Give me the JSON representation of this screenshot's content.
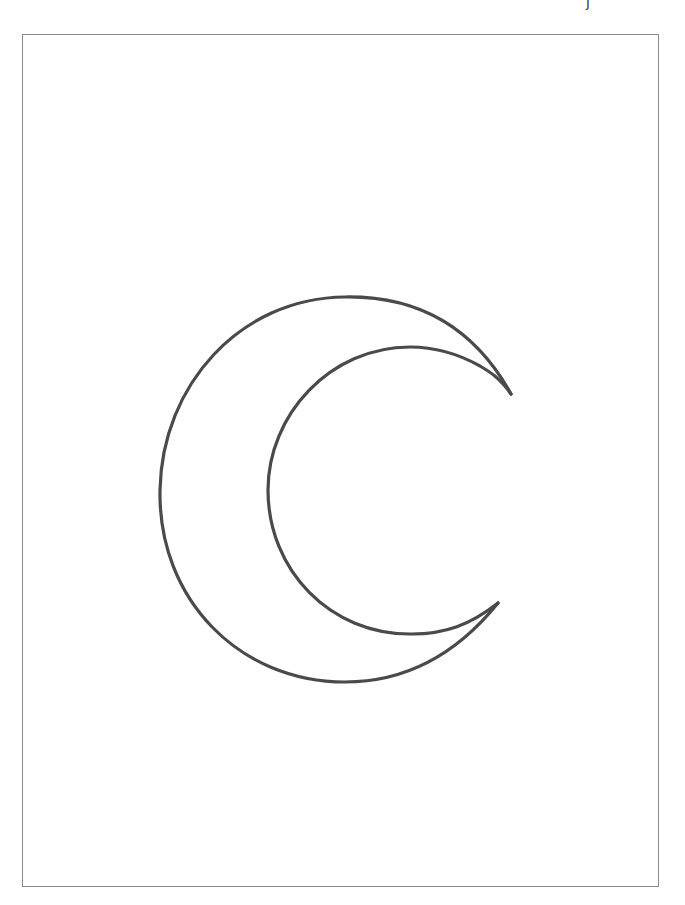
{
  "page": {
    "corner_mark": "j",
    "stroke_color": "#4a4a4a",
    "frame_color": "#8a8a8a",
    "background": "#ffffff"
  },
  "drawing": {
    "subject": "crescent-moon-outline",
    "style": "pencil line drawing"
  }
}
